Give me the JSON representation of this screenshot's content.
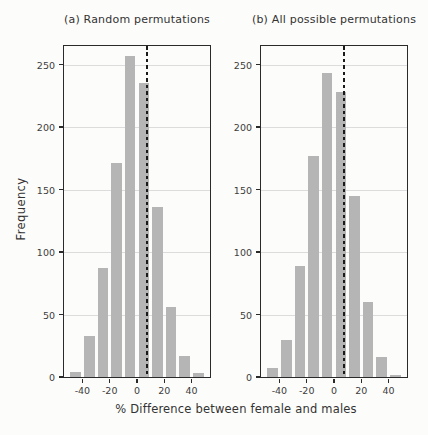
{
  "figure": {
    "ylabel": "Frequency",
    "xlabel": "% Difference between female and males"
  },
  "colors": {
    "background": "#fcfcfa",
    "bar": "#b5b5b5",
    "grid": "#dcdcdc",
    "frame": "#2a2a2a",
    "text": "#3d3d3d",
    "dashed_line": "#1a1a1a"
  },
  "chart_data": [
    {
      "type": "bar",
      "title": "(a) Random permutations",
      "xlabel": "% Difference between female and males",
      "ylabel": "Frequency",
      "bin_width": 10,
      "bin_centers": [
        -45,
        -35,
        -25,
        -15,
        -5,
        5,
        15,
        25,
        35,
        45
      ],
      "values": [
        4,
        33,
        87,
        171,
        257,
        235,
        136,
        56,
        17,
        3
      ],
      "observed_line_x": 7,
      "x_ticks": [
        -40,
        -20,
        0,
        20,
        40
      ],
      "y_ticks": [
        0,
        50,
        100,
        150,
        200,
        250
      ],
      "xlim": [
        -53.5,
        53.5
      ],
      "ylim": [
        0,
        265
      ],
      "grid": "horizontal",
      "legend": "none"
    },
    {
      "type": "bar",
      "title": "(b) All possible permutations",
      "xlabel": "% Difference between female and males",
      "ylabel": "Frequency",
      "bin_width": 10,
      "bin_centers": [
        -45,
        -35,
        -25,
        -15,
        -5,
        5,
        15,
        25,
        35,
        45
      ],
      "values": [
        7,
        30,
        89,
        177,
        243,
        228,
        145,
        60,
        16,
        2
      ],
      "observed_line_x": 7,
      "x_ticks": [
        -40,
        -20,
        0,
        20,
        40
      ],
      "y_ticks": [
        0,
        50,
        100,
        150,
        200,
        250
      ],
      "xlim": [
        -53.5,
        53.5
      ],
      "ylim": [
        0,
        265
      ],
      "grid": "horizontal",
      "legend": "none"
    }
  ]
}
